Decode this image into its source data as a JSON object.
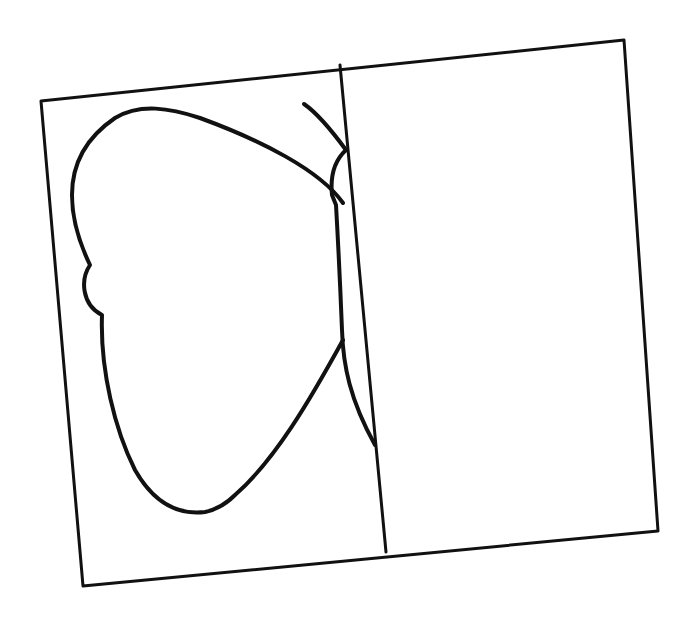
{
  "drawing": {
    "description": "Hand-drawn half butterfly in a tilted rectangle divided by a vertical line (symmetry exercise)",
    "colors": {
      "background": "#ffffff",
      "ink": "#111111"
    },
    "frame": {
      "corners": [
        [
          41,
          101
        ],
        [
          624,
          40
        ],
        [
          658,
          531
        ],
        [
          83,
          586
        ]
      ]
    },
    "divider": {
      "from": [
        340,
        65
      ],
      "to": [
        386,
        552
      ]
    },
    "butterfly": {
      "wing_path": "M 343 203 C 320 170, 260 140, 200 118 C 170 108, 140 103, 115 118 C 90 135, 72 160, 72 195 C 72 215, 78 240, 90 265 C 80 280, 82 305, 102 315 C 100 370, 115 430, 135 470 C 155 505, 180 515, 205 512 C 215 510, 225 505, 235 495 C 275 460, 310 400, 343 340",
      "body_path": "M 346 150 C 335 160, 330 175, 332 195 L 336 205 C 338 240, 340 280, 342 330 C 343 365, 350 400, 375 445",
      "antenna_path": "M 304 104 C 320 115, 335 135, 346 150"
    }
  }
}
